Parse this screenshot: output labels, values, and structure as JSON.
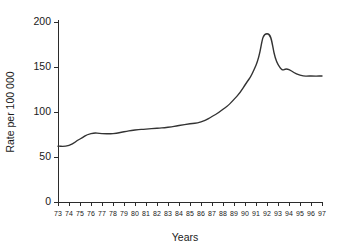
{
  "chart_data": {
    "type": "line",
    "title": "",
    "subtitle": "",
    "xlabel": "Years",
    "ylabel": "Rate per 100 000",
    "xlim": [
      73,
      97
    ],
    "ylim": [
      0,
      200
    ],
    "grid": false,
    "legend": false,
    "legend_position": "none",
    "line_color": "#333333",
    "axis_color": "#2b2b2b",
    "background_color": "#ffffff",
    "y_ticks": [
      0,
      50,
      100,
      150,
      200
    ],
    "y_tick_labels": [
      "0",
      "50",
      "100",
      "150",
      "200"
    ],
    "x_ticks": [
      73,
      74,
      75,
      76,
      77,
      78,
      79,
      80,
      81,
      82,
      83,
      84,
      85,
      86,
      87,
      88,
      89,
      90,
      91,
      92,
      93,
      94,
      95,
      96,
      97
    ],
    "x_tick_labels": [
      "73",
      "74",
      "75",
      "76",
      "77",
      "78",
      "79",
      "80",
      "81",
      "82",
      "83",
      "84",
      "85",
      "86",
      "87",
      "88",
      "89",
      "90",
      "91",
      "92",
      "93",
      "94",
      "95",
      "96",
      "97"
    ],
    "categories": [
      "73",
      "74",
      "75",
      "76",
      "77",
      "78",
      "79",
      "80",
      "81",
      "82",
      "83",
      "84",
      "85",
      "86",
      "87",
      "88",
      "89",
      "90",
      "91",
      "92",
      "93",
      "94",
      "95",
      "96",
      "97"
    ],
    "x": [
      73,
      74,
      75,
      76,
      77,
      78,
      79,
      80,
      81,
      82,
      83,
      84,
      85,
      86,
      87,
      88,
      89,
      90,
      91,
      92,
      93,
      94,
      95,
      96,
      97
    ],
    "values": [
      62,
      63,
      70,
      76,
      76,
      76,
      78,
      80,
      81,
      82,
      83,
      85,
      87,
      89,
      95,
      103,
      114,
      130,
      152,
      187,
      153,
      147,
      141,
      140,
      140
    ],
    "series": [
      {
        "name": "Rate per 100 000",
        "values": [
          62,
          63,
          70,
          76,
          76,
          76,
          78,
          80,
          81,
          82,
          83,
          85,
          87,
          89,
          95,
          103,
          114,
          130,
          152,
          187,
          153,
          147,
          141,
          140,
          140
        ]
      }
    ],
    "annotations": []
  }
}
